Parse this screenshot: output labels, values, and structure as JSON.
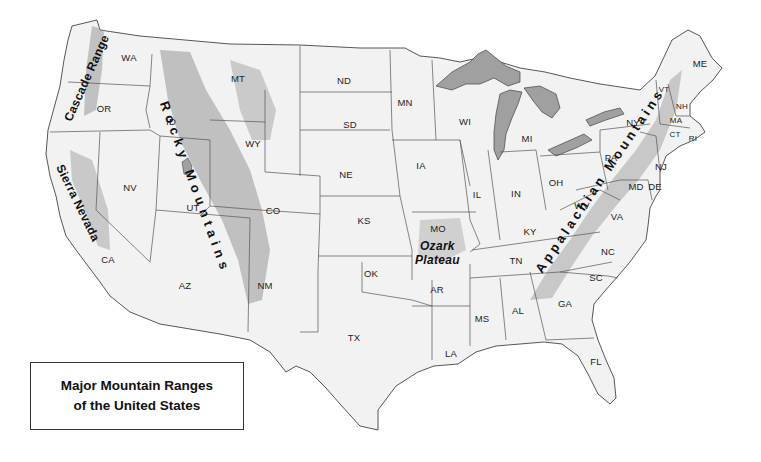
{
  "title": {
    "line1": "Major Mountain Ranges",
    "line2": "of the United States"
  },
  "colors": {
    "land": "#f1f1f1",
    "border": "#555555",
    "water": "#9e9e9e",
    "relief": "#b8b8b8",
    "text": "#111111"
  },
  "mountain_ranges": [
    {
      "id": "cascade",
      "label": "Cascade Range",
      "x": 82,
      "y": 78,
      "rotate": -66
    },
    {
      "id": "sierra",
      "label": "Sierra Nevada",
      "x": 74,
      "y": 202,
      "rotate": 64
    },
    {
      "id": "rocky",
      "label": "Rocky Mountains",
      "x": 216,
      "y": 188,
      "rotate": 70
    },
    {
      "id": "ozark",
      "label_line1": "Ozark",
      "label_line2": "Plateau",
      "x": 438,
      "y": 251
    },
    {
      "id": "appalachian",
      "label": "Appalachian Mountains",
      "x": 620,
      "y": 180,
      "rotate": -56
    }
  ],
  "states": [
    {
      "abbr": "WA",
      "x": 129,
      "y": 57
    },
    {
      "abbr": "OR",
      "x": 104,
      "y": 108
    },
    {
      "abbr": "CA",
      "x": 108,
      "y": 259
    },
    {
      "abbr": "NV",
      "x": 130,
      "y": 187
    },
    {
      "abbr": "ID",
      "x": 171,
      "y": 121
    },
    {
      "abbr": "MT",
      "x": 238,
      "y": 78
    },
    {
      "abbr": "WY",
      "x": 253,
      "y": 143
    },
    {
      "abbr": "UT",
      "x": 193,
      "y": 207
    },
    {
      "abbr": "CO",
      "x": 273,
      "y": 210
    },
    {
      "abbr": "AZ",
      "x": 185,
      "y": 285
    },
    {
      "abbr": "NM",
      "x": 265,
      "y": 285
    },
    {
      "abbr": "ND",
      "x": 344,
      "y": 80
    },
    {
      "abbr": "SD",
      "x": 350,
      "y": 124
    },
    {
      "abbr": "NE",
      "x": 346,
      "y": 174
    },
    {
      "abbr": "KS",
      "x": 364,
      "y": 220
    },
    {
      "abbr": "OK",
      "x": 371,
      "y": 273
    },
    {
      "abbr": "TX",
      "x": 354,
      "y": 337
    },
    {
      "abbr": "MN",
      "x": 405,
      "y": 102
    },
    {
      "abbr": "IA",
      "x": 421,
      "y": 165
    },
    {
      "abbr": "MO",
      "x": 438,
      "y": 228
    },
    {
      "abbr": "AR",
      "x": 437,
      "y": 289
    },
    {
      "abbr": "LA",
      "x": 451,
      "y": 353
    },
    {
      "abbr": "WI",
      "x": 465,
      "y": 121
    },
    {
      "abbr": "IL",
      "x": 477,
      "y": 194
    },
    {
      "abbr": "MI",
      "x": 527,
      "y": 138
    },
    {
      "abbr": "IN",
      "x": 516,
      "y": 193
    },
    {
      "abbr": "OH",
      "x": 556,
      "y": 182
    },
    {
      "abbr": "KY",
      "x": 530,
      "y": 231
    },
    {
      "abbr": "TN",
      "x": 516,
      "y": 260
    },
    {
      "abbr": "MS",
      "x": 482,
      "y": 318
    },
    {
      "abbr": "AL",
      "x": 518,
      "y": 310
    },
    {
      "abbr": "GA",
      "x": 565,
      "y": 303
    },
    {
      "abbr": "FL",
      "x": 596,
      "y": 361
    },
    {
      "abbr": "SC",
      "x": 596,
      "y": 277
    },
    {
      "abbr": "NC",
      "x": 608,
      "y": 251
    },
    {
      "abbr": "VA",
      "x": 617,
      "y": 216
    },
    {
      "abbr": "WV",
      "x": 582,
      "y": 205
    },
    {
      "abbr": "PA",
      "x": 611,
      "y": 157
    },
    {
      "abbr": "NY",
      "x": 633,
      "y": 122
    },
    {
      "abbr": "MD",
      "x": 636,
      "y": 186
    },
    {
      "abbr": "DE",
      "x": 655,
      "y": 186
    },
    {
      "abbr": "NJ",
      "x": 661,
      "y": 166
    },
    {
      "abbr": "CT",
      "x": 675,
      "y": 134,
      "small": true
    },
    {
      "abbr": "RI",
      "x": 693,
      "y": 138,
      "small": true
    },
    {
      "abbr": "MA",
      "x": 676,
      "y": 120,
      "small": true
    },
    {
      "abbr": "VT",
      "x": 664,
      "y": 89,
      "small": true
    },
    {
      "abbr": "NH",
      "x": 682,
      "y": 106,
      "small": true
    },
    {
      "abbr": "ME",
      "x": 700,
      "y": 63
    }
  ]
}
